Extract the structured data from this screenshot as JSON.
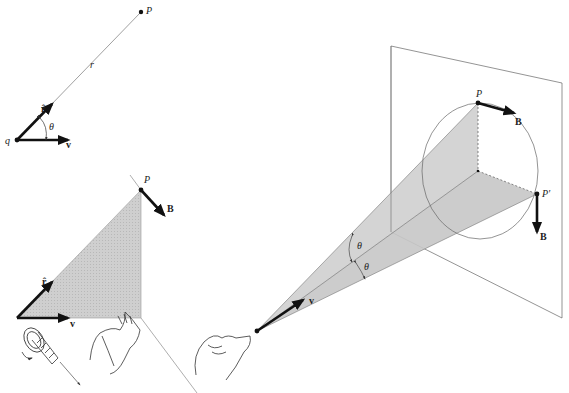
{
  "figure": {
    "colors": {
      "ink": "#1a1a1a",
      "shade": "#c8c8c8",
      "line": "#555555",
      "background": "#ffffff"
    }
  },
  "panel_a": {
    "charge_label": "q",
    "point_label": "P",
    "distance_label": "r",
    "unit_vector_label": "r̂",
    "angle_label": "θ",
    "velocity_label": "v"
  },
  "panel_b": {
    "point_label": "P",
    "field_label": "B",
    "unit_vector_label": "r̂",
    "velocity_label": "v",
    "illustrations": [
      "right-handed-screw",
      "right-hand"
    ]
  },
  "panel_c": {
    "point_label": "P",
    "point_prime_label": "P′",
    "field_label_1": "B",
    "field_label_2": "B",
    "angle_label_1": "θ",
    "angle_label_2": "θ",
    "velocity_label": "v",
    "illustrations": [
      "right-hand-thumb"
    ]
  }
}
